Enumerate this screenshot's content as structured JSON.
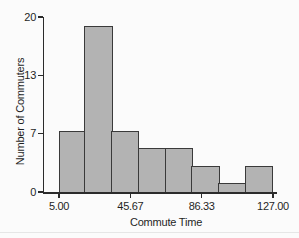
{
  "chart_data": {
    "type": "bar",
    "chart_kind": "histogram",
    "title": "",
    "xlabel": "Commute Time",
    "ylabel": "Number of Commuters",
    "xlim": [
      5.0,
      127.0
    ],
    "ylim": [
      0,
      20
    ],
    "x_ticks": [
      {
        "value": 5.0,
        "label": "5.00"
      },
      {
        "value": 45.67,
        "label": "45.67"
      },
      {
        "value": 86.33,
        "label": "86.33"
      },
      {
        "value": 127.0,
        "label": "127.00"
      }
    ],
    "y_ticks": [
      {
        "value": 0,
        "label": "0"
      },
      {
        "value": 7,
        "label": "7"
      },
      {
        "value": 13,
        "label": "13"
      },
      {
        "value": 20,
        "label": "20"
      }
    ],
    "bins": {
      "start": 5.0,
      "width": 15.25,
      "count": 8,
      "edges": [
        5.0,
        20.25,
        35.5,
        50.75,
        66.0,
        81.25,
        96.5,
        111.75,
        127.0
      ]
    },
    "values": [
      7,
      19,
      7,
      5,
      5,
      3,
      1,
      3
    ],
    "total_commuters": 50,
    "grid": false,
    "legend": false,
    "colors": {
      "bar_fill": "#b3b3b3",
      "bar_border": "#3a3a3a",
      "axis": "#2b2b2b",
      "text": "#1f1f1f",
      "background": "#fbfbfb"
    }
  }
}
